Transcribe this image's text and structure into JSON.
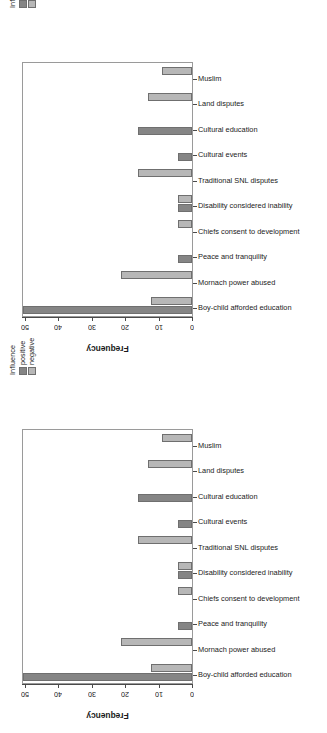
{
  "figure": {
    "panels": [
      "panel-top",
      "panel-bottom"
    ]
  },
  "legend": {
    "title": "Influence",
    "entries": [
      {
        "label": "positive",
        "color": "#858585"
      },
      {
        "label": "negative",
        "color": "#b7b7b7"
      }
    ]
  },
  "axis": {
    "value_title": "Frequency",
    "value_ticks": [
      "50",
      "40",
      "30",
      "20",
      "10",
      "0"
    ],
    "value_tick_numbers": [
      50,
      40,
      30,
      20,
      10,
      0
    ],
    "value_reversed": true,
    "value_min": 0,
    "value_max": 50
  },
  "chart_data": [
    {
      "type": "bar",
      "orientation": "horizontal",
      "title": "",
      "subtitle": "",
      "xlabel": "Frequency",
      "ylabel": "",
      "xlim": [
        50,
        0
      ],
      "grid": false,
      "legend_position": "top-left-rotated",
      "legend_title": "Influence",
      "categories": [
        "Muslim",
        "Land disputes",
        "Cultural education",
        "Cultural events",
        "Traditional SNL disputes",
        "Disability considered inability",
        "Chiefs consent to development",
        "Peace and tranquility",
        "Mornach power abused",
        "Boy-child afforded education"
      ],
      "series": [
        {
          "name": "positive",
          "color": "#858585",
          "values": [
            0,
            0,
            16,
            4,
            0,
            4,
            0,
            4,
            0,
            50
          ]
        },
        {
          "name": "negative",
          "color": "#b7b7b7",
          "values": [
            9,
            13,
            0,
            0,
            16,
            4,
            4,
            0,
            21,
            12
          ]
        }
      ]
    },
    {
      "type": "bar",
      "orientation": "horizontal",
      "title": "",
      "subtitle": "",
      "xlabel": "Frequency",
      "ylabel": "",
      "xlim": [
        50,
        0
      ],
      "grid": false,
      "legend_position": "top-left-rotated",
      "legend_title": "Influence",
      "categories": [
        "Muslim",
        "Land disputes",
        "Cultural education",
        "Cultural events",
        "Traditional SNL disputes",
        "Disability considered inability",
        "Chiefs consent to development",
        "Peace and tranquility",
        "Mornach power abused",
        "Boy-child afforded education"
      ],
      "series": [
        {
          "name": "positive",
          "color": "#858585",
          "values": [
            0,
            0,
            16,
            4,
            0,
            4,
            0,
            4,
            0,
            50
          ]
        },
        {
          "name": "negative",
          "color": "#b7b7b7",
          "values": [
            9,
            13,
            0,
            0,
            16,
            4,
            4,
            0,
            21,
            12
          ]
        }
      ]
    }
  ]
}
